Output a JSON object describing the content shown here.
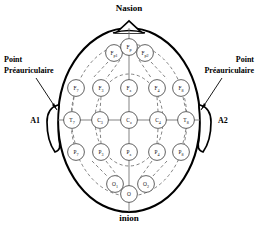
{
  "figure": {
    "type": "eeg-10-20-electrode-placement",
    "view": "top-down head map",
    "language": "fr"
  },
  "landmarks": {
    "top_label": "Nasion",
    "bottom_label": "inion",
    "left_ref_label": "A1",
    "right_ref_label": "A2",
    "left_annotation_line1": "Point",
    "left_annotation_line2": "Préauriculaire",
    "right_annotation_line1": "Point",
    "right_annotation_line2": "Préauriculaire"
  },
  "electrodes": [
    {
      "id": "Fp1",
      "base": "F",
      "sub": "p1",
      "cx": 114,
      "cy": 53,
      "r": 8.4
    },
    {
      "id": "Fp",
      "base": "F",
      "sub": "p",
      "cx": 129,
      "cy": 47,
      "r": 8.4
    },
    {
      "id": "Fp2",
      "base": "F",
      "sub": "p2",
      "cx": 145,
      "cy": 53,
      "r": 8.4
    },
    {
      "id": "F7",
      "base": "F",
      "sub": "7",
      "cx": 76,
      "cy": 88,
      "r": 8.4
    },
    {
      "id": "F3",
      "base": "F",
      "sub": "3",
      "cx": 101,
      "cy": 88,
      "r": 8.4
    },
    {
      "id": "Fz",
      "base": "F",
      "sub": "z",
      "cx": 129,
      "cy": 88,
      "r": 8.4
    },
    {
      "id": "F4",
      "base": "F",
      "sub": "4",
      "cx": 157,
      "cy": 88,
      "r": 8.4
    },
    {
      "id": "F8",
      "base": "F",
      "sub": "8",
      "cx": 181,
      "cy": 88,
      "r": 8.4
    },
    {
      "id": "T7",
      "base": "T",
      "sub": "7",
      "cx": 72,
      "cy": 120,
      "r": 8.4
    },
    {
      "id": "C3",
      "base": "C",
      "sub": "3",
      "cx": 100,
      "cy": 120,
      "r": 8.4
    },
    {
      "id": "Cz",
      "base": "C",
      "sub": "z",
      "cx": 129,
      "cy": 120,
      "r": 8.4
    },
    {
      "id": "C4",
      "base": "C",
      "sub": "4",
      "cx": 158,
      "cy": 120,
      "r": 8.4
    },
    {
      "id": "T8",
      "base": "T",
      "sub": "8",
      "cx": 186,
      "cy": 120,
      "r": 8.4
    },
    {
      "id": "P7",
      "base": "P",
      "sub": "7",
      "cx": 76,
      "cy": 152,
      "r": 8.4
    },
    {
      "id": "P3",
      "base": "P",
      "sub": "3",
      "cx": 101,
      "cy": 152,
      "r": 8.4
    },
    {
      "id": "Pz",
      "base": "P",
      "sub": "z",
      "cx": 129,
      "cy": 152,
      "r": 8.4
    },
    {
      "id": "P4",
      "base": "P",
      "sub": "4",
      "cx": 157,
      "cy": 152,
      "r": 8.4
    },
    {
      "id": "P8",
      "base": "P",
      "sub": "8",
      "cx": 181,
      "cy": 152,
      "r": 8.4
    },
    {
      "id": "O1",
      "base": "O",
      "sub": "1",
      "cx": 115,
      "cy": 184,
      "r": 8.4
    },
    {
      "id": "O2",
      "base": "O",
      "sub": "2",
      "cx": 146,
      "cy": 184,
      "r": 8.4
    },
    {
      "id": "Oz",
      "base": "O",
      "sub": "",
      "cx": 129,
      "cy": 194,
      "r": 8.4
    }
  ],
  "colors": {
    "outline": "#000000",
    "electrode_stroke": "#3a3a3a",
    "connector": "#6d6d6d",
    "background": "#ffffff",
    "text": "#000000"
  }
}
